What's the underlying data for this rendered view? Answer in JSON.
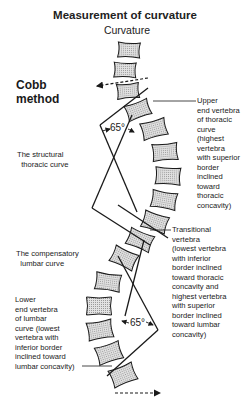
{
  "header": {
    "title": "Measurement of curvature",
    "subtitle": "Curvature"
  },
  "method": {
    "line1": "Cobb",
    "line2": "method"
  },
  "labels": {
    "structural_curve": "The structural\n  thoracic curve",
    "compensatory_curve": "The compensatory\n  lumbar curve",
    "upper_end_vertebra": "Upper\nend vertebra\nof thoracic\ncurve\n(highest\nvertebra\nwith superior\nborder\ninclined\ntoward\nthoracic\nconcavity)",
    "transitional_vertebra": "Transitional\nvertebra\n(lowest vertebra\nwith inferior\nborder inclined\ntoward thoracic\nconcavity and\nhighest vertebra\nwith superior\nborder inclined\ntoward lumbar\nconcavity)",
    "lower_end_vertebra": "Lower\nend vertebra\nof lumbar\ncurve (lowest\nvertebra with\ninferior border\ninclined toward\nlumbar concavity)"
  },
  "angles": {
    "thoracic": "65°",
    "lumbar": "65°"
  },
  "colors": {
    "line": "#1a1a1a",
    "vertebra_fill": "#c8c8c8",
    "background": "#ffffff"
  },
  "vertebrae": [
    {
      "cx": 129,
      "cy": 50,
      "w": 22,
      "h": 15,
      "rot": 3
    },
    {
      "cx": 125,
      "cy": 70,
      "w": 22,
      "h": 15,
      "rot": 2
    },
    {
      "cx": 128,
      "cy": 91,
      "w": 22,
      "h": 15,
      "rot": -5
    },
    {
      "cx": 138,
      "cy": 110,
      "w": 24,
      "h": 16,
      "rot": -20
    },
    {
      "cx": 154,
      "cy": 129,
      "w": 25,
      "h": 17,
      "rot": -15
    },
    {
      "cx": 165,
      "cy": 152,
      "w": 25,
      "h": 17,
      "rot": -5
    },
    {
      "cx": 168,
      "cy": 176,
      "w": 25,
      "h": 17,
      "rot": 3
    },
    {
      "cx": 164,
      "cy": 200,
      "w": 25,
      "h": 17,
      "rot": 10
    },
    {
      "cx": 155,
      "cy": 222,
      "w": 25,
      "h": 17,
      "rot": 18
    },
    {
      "cx": 140,
      "cy": 240,
      "w": 25,
      "h": 17,
      "rot": 22
    },
    {
      "cx": 124,
      "cy": 258,
      "w": 25,
      "h": 17,
      "rot": 25
    },
    {
      "cx": 108,
      "cy": 282,
      "w": 25,
      "h": 17,
      "rot": 8
    },
    {
      "cx": 99,
      "cy": 306,
      "w": 25,
      "h": 18,
      "rot": 0
    },
    {
      "cx": 100,
      "cy": 330,
      "w": 25,
      "h": 18,
      "rot": -10
    },
    {
      "cx": 109,
      "cy": 353,
      "w": 25,
      "h": 18,
      "rot": -18
    },
    {
      "cx": 123,
      "cy": 375,
      "w": 25,
      "h": 18,
      "rot": -22
    }
  ]
}
